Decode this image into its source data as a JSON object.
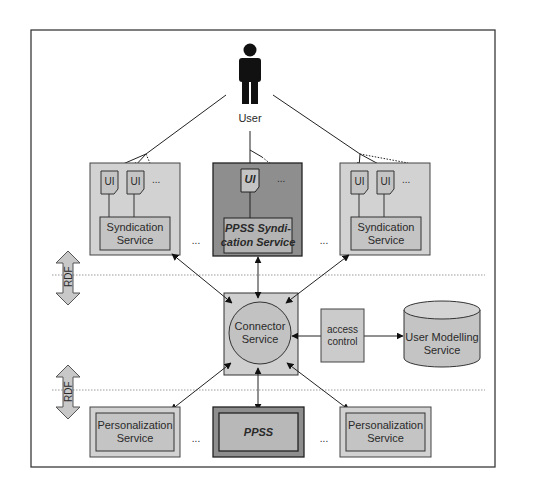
{
  "diagram": {
    "colors": {
      "frame": "#3a3a3a",
      "box_fill": "#c8c8c8",
      "box_outer_fill": "#d2d2d2",
      "dark_fill": "#8e8e8e",
      "inner_dark_fill": "#b4b4b4",
      "line": "#222222",
      "dotted": "#9a9a9a"
    },
    "user": {
      "label": "User"
    },
    "syndication_row": {
      "left": {
        "ui_labels": [
          "UI",
          "UI"
        ],
        "more": "...",
        "service_line1": "Syndication",
        "service_line2": "Service"
      },
      "center": {
        "ui_labels": [
          "UI"
        ],
        "more": "...",
        "service_line1": "PPSS Syndi-",
        "service_line2": "cation Service"
      },
      "right": {
        "ui_labels": [
          "UI",
          "UI"
        ],
        "more": "...",
        "service_line1": "Syndication",
        "service_line2": "Service"
      },
      "gap_left": "...",
      "gap_right": "..."
    },
    "rdf_arrows": [
      {
        "label": "RDF"
      },
      {
        "label": "RDF"
      }
    ],
    "connector": {
      "line1": "Connector",
      "line2": "Service"
    },
    "access_control": {
      "line1": "access",
      "line2": "control"
    },
    "user_modelling": {
      "line1": "User Modelling",
      "line2": "Service"
    },
    "personalization_row": {
      "left": {
        "line1": "Personalization",
        "line2": "Service"
      },
      "center": {
        "label": "PPSS"
      },
      "right": {
        "line1": "Personalization",
        "line2": "Service"
      },
      "gap_left": "...",
      "gap_right": "..."
    }
  }
}
